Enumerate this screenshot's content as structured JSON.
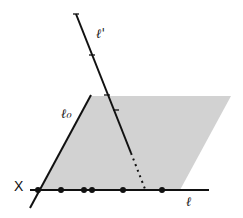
{
  "diagram": {
    "labels": {
      "line_prime": "ℓ'",
      "line_zero": "ℓ₀",
      "point_x": "X",
      "line_base": "ℓ"
    },
    "colors": {
      "shade": "#cfcfcf",
      "ink": "#111111",
      "background": "#ffffff"
    },
    "base_line_points_x": [
      38,
      61,
      84,
      92,
      123,
      162
    ],
    "line_prime_ticks": [
      [
        76,
        14
      ],
      [
        92,
        55
      ],
      [
        107,
        95
      ]
    ]
  }
}
